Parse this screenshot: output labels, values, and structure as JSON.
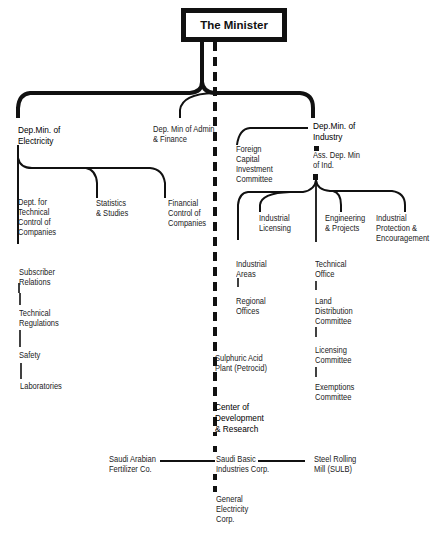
{
  "title": "The Minister",
  "branches": {
    "electricity": {
      "head": "Dep.Min. of\nElectricity",
      "sub_branches": [
        "Dept. for\nTechnical\nControl of\nCompanies",
        "Statistics\n& Studies",
        "Financial\nControl of\nCompanies"
      ],
      "chain": [
        "Subscriber\nRelations",
        "Technical\nRegulations",
        "Safety",
        "Laboratories"
      ]
    },
    "admin": {
      "head": "Dep. Min of Admin\n& Finance"
    },
    "industry": {
      "head": "Dep.Min. of\nIndustry",
      "committee": "Foreign\nCapital\nInvestment\nCommittee",
      "assistant": "Ass. Dep. Min\nof Ind.",
      "departments": [
        "Industrial\nLicensing",
        "Engineering\n& Projects",
        "Industrial\nProtection &\nEncouragement"
      ],
      "areas_chain": [
        "Industrial\nAreas",
        "Regional\nOffices"
      ],
      "office_chain": [
        "Technical\nOffice",
        "Land\nDistribution\nCommittee",
        "Licensing\nCommittee",
        "Exemptions\nCommittee"
      ]
    }
  },
  "dashed_chain": {
    "items": [
      "Sulphuric Acid\nPlant (Petrocid)",
      "Center of\nDevelopment\n& Research",
      "Saudi Basic\nIndustries Corp.",
      "General\nElectricity\nCorp."
    ],
    "sabic_left": "Saudi Arabian\nFertilizer Co.",
    "sabic_right": "Steel Rolling\nMill (SULB)"
  }
}
